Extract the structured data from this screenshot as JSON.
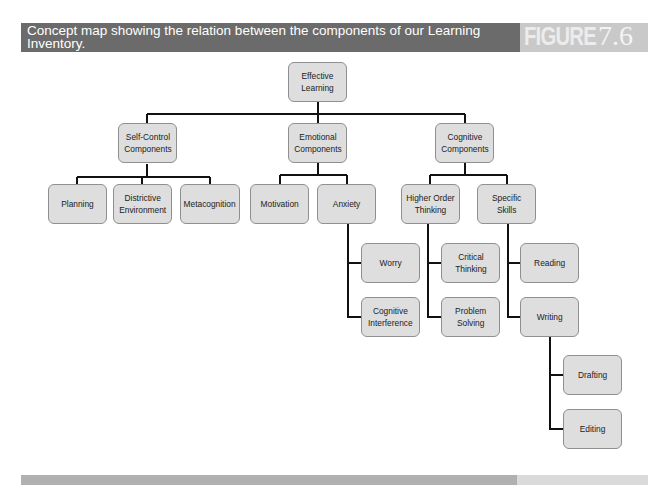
{
  "header": {
    "caption": "Concept map showing the relation between the components of our Learning Inventory.",
    "figure_label": "FIGURE",
    "figure_number": "7.6"
  },
  "colors": {
    "header_bg": "#6b6b6b",
    "figure_bg": "#c9c9c9",
    "node_fill": "#dedede",
    "node_border": "#8f8f8f",
    "connector": "#111111",
    "footer_dark": "#b0b0b0",
    "footer_light": "#dadada"
  },
  "diagram": {
    "root": {
      "label": "Effective\nLearning"
    },
    "self_control": {
      "label": "Self-Control\nComponents",
      "children": [
        {
          "label": "Planning"
        },
        {
          "label": "Districtive\nEnvironment"
        },
        {
          "label": "Metacognition"
        }
      ]
    },
    "emotional": {
      "label": "Emotional\nComponents",
      "children": [
        {
          "label": "Motivation"
        },
        {
          "label": "Anxiety",
          "children": [
            {
              "label": "Worry"
            },
            {
              "label": "Cognitive\nInterference"
            }
          ]
        }
      ]
    },
    "cognitive": {
      "label": "Cognitive\nComponents",
      "children": [
        {
          "label": "Higher Order\nThinking",
          "children": [
            {
              "label": "Critical\nThinking"
            },
            {
              "label": "Problem\nSolving"
            }
          ]
        },
        {
          "label": "Specific\nSkills",
          "children": [
            {
              "label": "Reading"
            },
            {
              "label": "Writing",
              "children": [
                {
                  "label": "Drafting"
                },
                {
                  "label": "Editing"
                }
              ]
            }
          ]
        }
      ]
    }
  }
}
